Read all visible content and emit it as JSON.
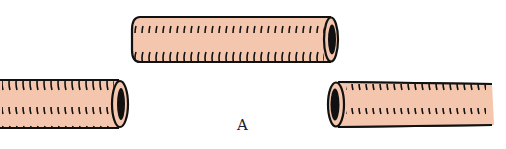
{
  "figure": {
    "label": "A",
    "colors": {
      "tube_fill": "#f3c6ad",
      "outline": "#111111",
      "background": "#ffffff"
    },
    "tubes": [
      {
        "name": "top-tube",
        "open_end": "right"
      },
      {
        "name": "left-tube",
        "open_end": "right"
      },
      {
        "name": "right-tube",
        "open_end": "left"
      }
    ]
  }
}
